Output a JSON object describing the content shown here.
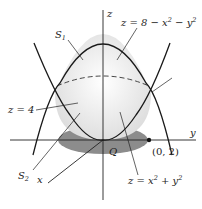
{
  "diagram": {
    "axes": {
      "z_label": "z",
      "y_label": "y",
      "x_label": "x"
    },
    "surfaces": {
      "upper_label": "S",
      "upper_sub": "1",
      "lower_label": "S",
      "lower_sub": "2",
      "upper_equation": {
        "lhs": "z = 8 − x",
        "mid": " − y",
        "exp1": "2",
        "exp2": "2"
      },
      "lower_equation": {
        "lhs": "z = x",
        "mid": " + y",
        "exp1": "2",
        "exp2": "2"
      }
    },
    "plane_label": "z = 4",
    "region_label": "Q",
    "point_label": "(0, 2)",
    "colors": {
      "curve": "#1a1a1a",
      "region_fill": "#8c8c8c",
      "surface_shade": "#e6e6e6"
    }
  }
}
